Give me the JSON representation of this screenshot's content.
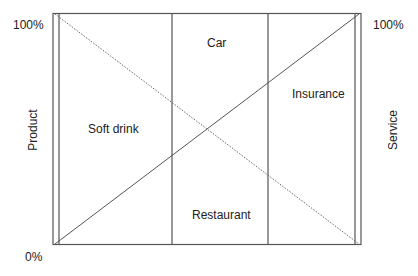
{
  "diagram": {
    "type": "product-service continuum",
    "left_axis": {
      "label": "Product",
      "top_tick": "100%",
      "bottom_tick": "0%"
    },
    "right_axis": {
      "label": "Service",
      "top_tick": "100%"
    },
    "segments": [
      {
        "name": "Soft drink"
      },
      {
        "name": "Car"
      },
      {
        "name": "Restaurant"
      },
      {
        "name": "Insurance"
      }
    ],
    "lines": {
      "solid_diagonal": "bottom-left to top-right (service share rising)",
      "dotted_diagonal": "top-left to bottom-right (product share falling)"
    },
    "colors": {
      "line": "#555555",
      "text": "#222222",
      "background": "#ffffff"
    }
  }
}
